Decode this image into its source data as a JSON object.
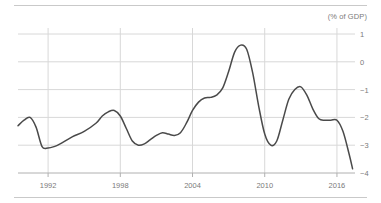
{
  "chart_data": {
    "type": "line",
    "title": "",
    "subtitle": "",
    "unit_label": "(% of GDP)",
    "xlabel": "",
    "ylabel": "",
    "xlim": [
      1989.5,
      2017.5
    ],
    "ylim": [
      -4,
      1
    ],
    "grid": true,
    "legend": false,
    "y_ticks": [
      1,
      0,
      -1,
      -2,
      -3,
      -4
    ],
    "y_tick_labels": [
      "1",
      "0",
      "−1",
      "−2",
      "−3",
      "−4"
    ],
    "x_ticks": [
      1992,
      1998,
      2004,
      2010,
      2016
    ],
    "x_tick_labels": [
      "1992",
      "1998",
      "2004",
      "2010",
      "2016"
    ],
    "line_color": "#4a4a4a",
    "grid_color": "#d8d8d8",
    "axis_color": "#b0b0b0",
    "series": [
      {
        "name": "Balance",
        "x": [
          1989.5,
          1990,
          1990.5,
          1991,
          1991.5,
          1992,
          1992.5,
          1993,
          1994,
          1995,
          1996,
          1996.5,
          1997,
          1997.5,
          1998,
          1998.5,
          1999,
          1999.5,
          2000,
          2000.5,
          2001,
          2001.5,
          2002,
          2002.5,
          2003,
          2003.5,
          2004,
          2004.5,
          2005,
          2005.5,
          2006,
          2006.5,
          2007,
          2007.5,
          2008,
          2008.5,
          2009,
          2009.5,
          2010,
          2010.5,
          2011,
          2011.5,
          2012,
          2012.5,
          2013,
          2013.5,
          2014,
          2014.5,
          2015,
          2015.5,
          2016,
          2016.5,
          2017,
          2017.3
        ],
        "y": [
          -2.3,
          -2.1,
          -2.0,
          -2.35,
          -3.05,
          -3.1,
          -3.05,
          -2.95,
          -2.7,
          -2.5,
          -2.2,
          -1.95,
          -1.8,
          -1.75,
          -1.95,
          -2.4,
          -2.85,
          -3.0,
          -2.95,
          -2.8,
          -2.65,
          -2.55,
          -2.6,
          -2.65,
          -2.55,
          -2.2,
          -1.75,
          -1.45,
          -1.3,
          -1.28,
          -1.2,
          -0.95,
          -0.35,
          0.35,
          0.6,
          0.45,
          -0.4,
          -1.6,
          -2.6,
          -3.0,
          -2.85,
          -2.1,
          -1.35,
          -1.0,
          -0.9,
          -1.2,
          -1.7,
          -2.05,
          -2.1,
          -2.1,
          -2.1,
          -2.5,
          -3.3,
          -3.85
        ]
      }
    ],
    "annotations": []
  }
}
